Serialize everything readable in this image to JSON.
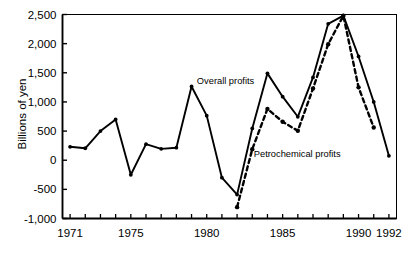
{
  "chart_data": {
    "type": "line",
    "title": "",
    "subtitle": "",
    "xlabel": "",
    "ylabel": "Billions of yen",
    "xlim": [
      1970.5,
      1992.5
    ],
    "ylim": [
      -1000,
      2500
    ],
    "grid": false,
    "legend_position": "inline-annotation",
    "x_ticks_all": [
      1971,
      1972,
      1973,
      1974,
      1975,
      1976,
      1977,
      1978,
      1979,
      1980,
      1981,
      1982,
      1983,
      1984,
      1985,
      1986,
      1987,
      1988,
      1989,
      1990,
      1991,
      1992
    ],
    "x_tick_labels": [
      "1971",
      "1975",
      "1980",
      "1985",
      "1990",
      "1992"
    ],
    "x_tick_label_values": [
      1971,
      1975,
      1980,
      1985,
      1990,
      1992
    ],
    "y_ticks": [
      -1000,
      -500,
      0,
      500,
      1000,
      1500,
      2000,
      2500
    ],
    "y_tick_labels": [
      "-1,000",
      "-500",
      "0",
      "500",
      "1,000",
      "1,500",
      "2,000",
      "2,500"
    ],
    "series": [
      {
        "name": "Overall profits",
        "style": "solid",
        "color": "#000000",
        "marker": "filled-circle",
        "annotation": "Overall profits",
        "x": [
          1971,
          1972,
          1973,
          1974,
          1975,
          1976,
          1977,
          1978,
          1979,
          1980,
          1981,
          1982,
          1983,
          1984,
          1985,
          1986,
          1987,
          1988,
          1989,
          1990,
          1991,
          1992
        ],
        "values": [
          230,
          205,
          500,
          700,
          -250,
          275,
          195,
          215,
          1265,
          765,
          -300,
          -590,
          545,
          1490,
          1090,
          745,
          1420,
          2340,
          2480,
          1780,
          1000,
          75
        ]
      },
      {
        "name": "Petrochemical profits",
        "style": "dashed",
        "color": "#000000",
        "marker": "filled-circle",
        "annotation": "Petrochemical profits",
        "x": [
          1982,
          1983,
          1984,
          1985,
          1986,
          1987,
          1988,
          1989,
          1990,
          1991
        ],
        "values": [
          -805,
          190,
          880,
          660,
          505,
          1230,
          1990,
          2480,
          1250,
          560
        ]
      }
    ],
    "annotations": [
      {
        "text": "Overall profits",
        "x": 1979.35,
        "y": 1300
      },
      {
        "text": "Petrochemical profits",
        "x": 1983.1,
        "y": 55
      }
    ]
  }
}
